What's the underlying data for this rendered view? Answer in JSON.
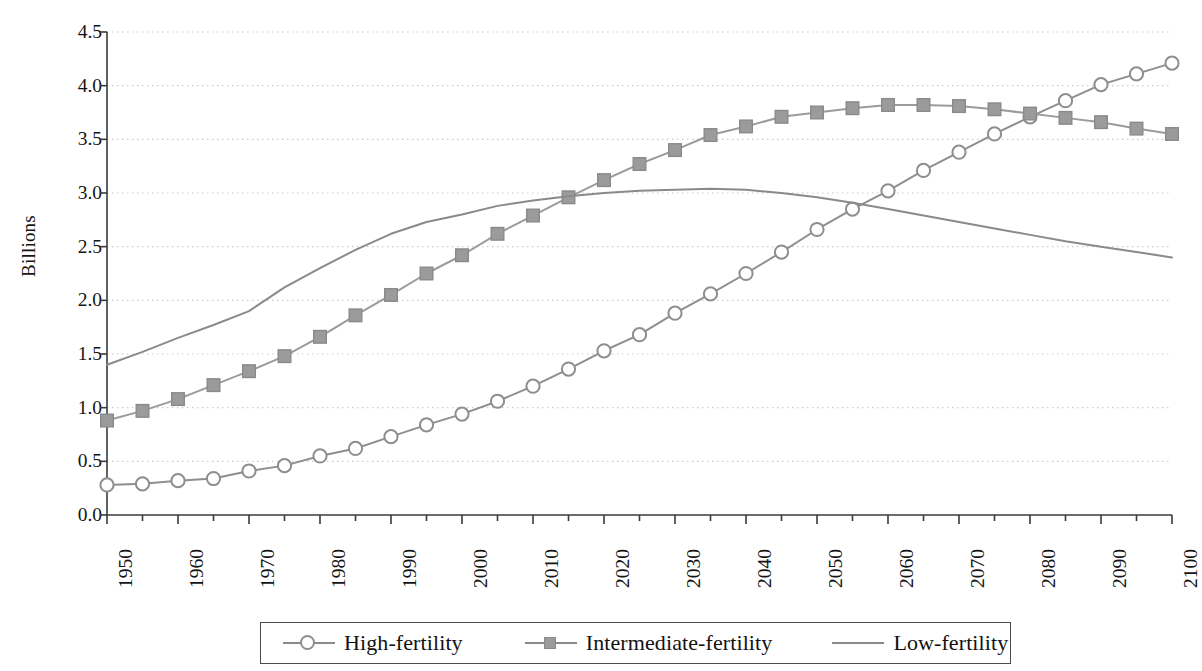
{
  "chart_data": {
    "type": "line",
    "title": "",
    "xlabel": "",
    "ylabel": "Billions",
    "xlim": [
      1950,
      2100
    ],
    "ylim": [
      0.0,
      4.5
    ],
    "ytick_values": [
      0.0,
      0.5,
      1.0,
      1.5,
      2.0,
      2.5,
      3.0,
      3.5,
      4.0,
      4.5
    ],
    "ytick_labels": [
      "0.0",
      "0.5",
      "1.0",
      "1.5",
      "2.0",
      "2.5",
      "3.0",
      "3.5",
      "4.0",
      "4.5"
    ],
    "xtick_values": [
      1950,
      1960,
      1970,
      1980,
      1990,
      2000,
      2010,
      2020,
      2030,
      2040,
      2050,
      2060,
      2070,
      2080,
      2090,
      2100
    ],
    "xtick_labels": [
      "1950",
      "1960",
      "1970",
      "1980",
      "1990",
      "2000",
      "2010",
      "2020",
      "2030",
      "2040",
      "2050",
      "2060",
      "2070",
      "2080",
      "2090",
      "2100"
    ],
    "xminor_step": 5,
    "grid": "horizontal-dotted",
    "legend_position": "below-center",
    "x": [
      1950,
      1955,
      1960,
      1965,
      1970,
      1975,
      1980,
      1985,
      1990,
      1995,
      2000,
      2005,
      2010,
      2015,
      2020,
      2025,
      2030,
      2035,
      2040,
      2045,
      2050,
      2055,
      2060,
      2065,
      2070,
      2075,
      2080,
      2085,
      2090,
      2095,
      2100
    ],
    "series": [
      {
        "name": "High-fertility",
        "marker": "open-circle",
        "color": "#8e8e8e",
        "values": [
          0.28,
          0.29,
          0.32,
          0.34,
          0.41,
          0.46,
          0.55,
          0.62,
          0.73,
          0.84,
          0.94,
          1.06,
          1.2,
          1.36,
          1.53,
          1.68,
          1.88,
          2.06,
          2.25,
          2.45,
          2.66,
          2.85,
          3.02,
          3.21,
          3.38,
          3.55,
          3.71,
          3.86,
          4.01,
          4.11,
          4.21
        ]
      },
      {
        "name": "Intermediate-fertility",
        "marker": "filled-square",
        "color": "#9b9b9b",
        "values": [
          0.88,
          0.97,
          1.08,
          1.21,
          1.34,
          1.48,
          1.66,
          1.86,
          2.05,
          2.25,
          2.42,
          2.62,
          2.79,
          2.96,
          3.12,
          3.27,
          3.4,
          3.54,
          3.62,
          3.71,
          3.75,
          3.79,
          3.82,
          3.82,
          3.81,
          3.78,
          3.74,
          3.7,
          3.66,
          3.6,
          3.55
        ]
      },
      {
        "name": "Low-fertility",
        "marker": "none",
        "color": "#8a8a8a",
        "values": [
          1.4,
          1.52,
          1.65,
          1.77,
          1.9,
          2.12,
          2.3,
          2.47,
          2.62,
          2.73,
          2.8,
          2.88,
          2.93,
          2.97,
          3.0,
          3.02,
          3.03,
          3.04,
          3.03,
          3.0,
          2.96,
          2.91,
          2.85,
          2.79,
          2.73,
          2.67,
          2.61,
          2.55,
          2.5,
          2.45,
          2.4
        ]
      }
    ]
  },
  "legend": {
    "items": [
      {
        "label": "High-fertility",
        "key": "line-with-open-circle"
      },
      {
        "label": "Intermediate-fertility",
        "key": "line-with-filled-square"
      },
      {
        "label": "Low-fertility",
        "key": "plain-line"
      }
    ]
  },
  "axis": {
    "y_title": "Billions"
  },
  "colors": {
    "series_gray": "#8e8e8e",
    "marker_fill": "#9b9b9b",
    "grid": "#c8c8c8",
    "axis": "#3a3a3a",
    "text": "#141414"
  }
}
